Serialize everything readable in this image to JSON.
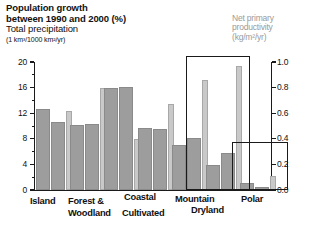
{
  "header": {
    "line1": "Population growth",
    "line2": "between 1990 and 2000 (%)",
    "line3": "Total precipitation",
    "line4": "(1 km³/1000 km²/yr)"
  },
  "secondary_axis_title": {
    "line1": "Net primary",
    "line2": "productivity",
    "line3": "(kg/m²/yr)"
  },
  "colors": {
    "series_dark": "#9d9d9d",
    "series_light": "#c9c9c9",
    "axis": "#1a1a1a",
    "npp_title": "#9a9a9a",
    "highlight_box": "#1a1a1a",
    "background": "#ffffff"
  },
  "axes": {
    "left_ticks": [
      "0",
      "4",
      "8",
      "12",
      "16",
      "20"
    ],
    "right_ticks": [
      "0.0",
      "0.2",
      "0.4",
      "0.6",
      "0.8",
      "1.0"
    ],
    "left_min": 0,
    "left_max": 20,
    "right_min": 0.0,
    "right_max": 1.0
  },
  "highlight_boxes": [
    {
      "label": "Dryland",
      "x": 186,
      "y": 56,
      "w": 64,
      "h": 134
    },
    {
      "label": "Polar",
      "x": 232,
      "y": 142,
      "w": 56,
      "h": 48
    }
  ],
  "chart_data": {
    "type": "bar",
    "subtitle": "Net primary productivity (kg/m²/yr)",
    "xlabel": "",
    "ylabel": "Population growth between 1990 and 2000 (%) / Total precipitation (1 km³/1000 km²/yr)",
    "y2label": "Net primary productivity (kg/m²/yr)",
    "ylim": [
      0,
      20
    ],
    "y2lim": [
      0.0,
      1.0
    ],
    "grid": false,
    "legend_position": "none",
    "categories": [
      "Island",
      "Forest & Woodland",
      "Coastal",
      "Cultivated",
      "Mountain",
      "Dryland",
      "Polar"
    ],
    "series": [
      {
        "name": "Population growth (%)",
        "axis": "left",
        "values": [
          12.7,
          10.2,
          16.0,
          9.7,
          7.0,
          3.9,
          1.1
        ]
      },
      {
        "name": "Total precipitation (1 km³/1000 km²/yr)",
        "axis": "left",
        "values": [
          10.7,
          10.3,
          16.1,
          9.6,
          8.2,
          5.8,
          0.5
        ]
      },
      {
        "name": "Net primary productivity (kg/m²/yr)",
        "axis": "right",
        "values": [
          0.62,
          0.8,
          0.4,
          0.67,
          0.86,
          0.97,
          0.11
        ]
      }
    ]
  }
}
